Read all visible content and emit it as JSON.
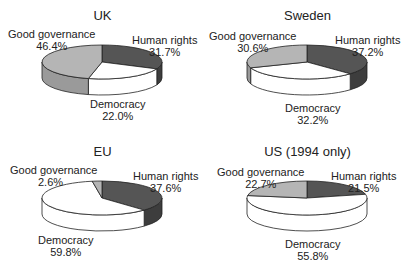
{
  "chart_data": [
    {
      "type": "pie",
      "title": "UK",
      "categories": [
        "Human rights",
        "Democracy",
        "Good governance"
      ],
      "values": [
        31.7,
        22.0,
        46.4
      ],
      "labels": [
        "31.7%",
        "22.0%",
        "46.4%"
      ]
    },
    {
      "type": "pie",
      "title": "Sweden",
      "categories": [
        "Human rights",
        "Democracy",
        "Good governance"
      ],
      "values": [
        37.2,
        32.2,
        30.6
      ],
      "labels": [
        "37.2%",
        "32.2%",
        "30.6%"
      ]
    },
    {
      "type": "pie",
      "title": "EU",
      "categories": [
        "Human rights",
        "Democracy",
        "Good governance"
      ],
      "values": [
        37.6,
        59.8,
        2.6
      ],
      "labels": [
        "37.6%",
        "59.8%",
        "2.6%"
      ]
    },
    {
      "type": "pie",
      "title": "US (1994 only)",
      "categories": [
        "Human rights",
        "Democracy",
        "Good governance"
      ],
      "values": [
        21.5,
        55.8,
        22.7
      ],
      "labels": [
        "21.5%",
        "55.8%",
        "22.7%"
      ]
    }
  ],
  "colors": {
    "human_rights": "#555555",
    "democracy": "#ffffff",
    "good_governance": "#b5b5b5",
    "outline": "#222222"
  }
}
